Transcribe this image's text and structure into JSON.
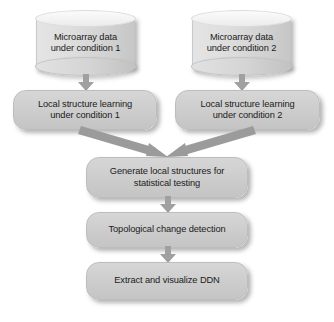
{
  "diagram": {
    "background_color": "#ffffff",
    "node_fill_color": "#cfcfcf",
    "node_border_color": "#bdbdbd",
    "arrow_color": "#9a9a9a",
    "text_color": "#1b1b1b"
  },
  "nodes": {
    "data_source_1": {
      "shape": "cylinder",
      "line1": "Microarray data",
      "line2": "under condition 1"
    },
    "data_source_2": {
      "shape": "cylinder",
      "line1": "Microarray data",
      "line2": "under condition 2"
    },
    "learning_1": {
      "shape": "rounded-rect",
      "line1": "Local structure learning",
      "line2": "under condition 1"
    },
    "learning_2": {
      "shape": "rounded-rect",
      "line1": "Local structure learning",
      "line2": "under condition 2"
    },
    "generate": {
      "shape": "rounded-rect",
      "line1": "Generate local structures for",
      "line2": "statistical testing"
    },
    "detection": {
      "shape": "rounded-rect",
      "line1": "Topological change detection"
    },
    "extract": {
      "shape": "rounded-rect",
      "line1": "Extract and visualize DDN"
    }
  },
  "edges": [
    {
      "name": "data-1-to-learning-1",
      "from": "data_source_1",
      "to": "learning_1",
      "direction": "down"
    },
    {
      "name": "data-2-to-learning-2",
      "from": "data_source_2",
      "to": "learning_2",
      "direction": "down"
    },
    {
      "name": "learning-1-to-generate",
      "from": "learning_1",
      "to": "generate",
      "direction": "diagonal-down-right"
    },
    {
      "name": "learning-2-to-generate",
      "from": "learning_2",
      "to": "generate",
      "direction": "diagonal-down-left"
    },
    {
      "name": "generate-to-detection",
      "from": "generate",
      "to": "detection",
      "direction": "down"
    },
    {
      "name": "detection-to-extract",
      "from": "detection",
      "to": "extract",
      "direction": "down"
    }
  ]
}
